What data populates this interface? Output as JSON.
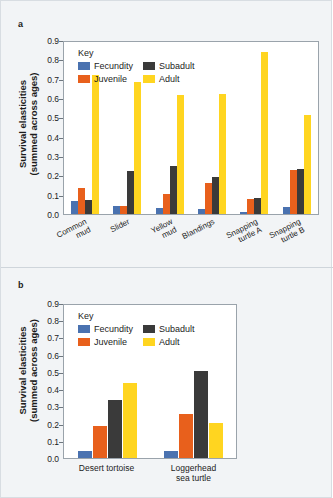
{
  "figure": {
    "background": "#f2f4f6",
    "panel_a_label": "a",
    "panel_b_label": "b"
  },
  "axis": {
    "ylabel_line1": "Survival elasticities",
    "ylabel_line2": "(summed across ages)",
    "yticks": [
      "0.9",
      "0.8",
      "0.7",
      "0.6",
      "0.5",
      "0.4",
      "0.3",
      "0.2",
      "0.1",
      "0.0"
    ]
  },
  "legend": {
    "title": "Key",
    "items": [
      {
        "label": "Fecundity",
        "color": "#4a72b0"
      },
      {
        "label": "Subadult",
        "color": "#3a3a3a"
      },
      {
        "label": "Juvenile",
        "color": "#e8601c"
      },
      {
        "label": "Adult",
        "color": "#ffd520"
      }
    ]
  },
  "chart_data": [
    {
      "type": "bar",
      "panel": "a",
      "title": "",
      "xlabel": "",
      "ylabel": "Survival elasticities (summed across ages)",
      "ylim": [
        0,
        0.9
      ],
      "ytick_step": 0.1,
      "grid": false,
      "legend_position": "inside-top-left",
      "categories": [
        "Common mud",
        "Slider",
        "Yellow mud",
        "Blandings",
        "Snapping turtle A",
        "Snapping turtle B"
      ],
      "category_lines": [
        [
          "Common",
          "mud"
        ],
        [
          "Slider"
        ],
        [
          "Yellow",
          "mud"
        ],
        [
          "Blandings"
        ],
        [
          "Snapping",
          "turtle A"
        ],
        [
          "Snapping",
          "turtle B"
        ]
      ],
      "series": [
        {
          "name": "Fecundity",
          "color": "#4a72b0",
          "values": [
            0.065,
            0.04,
            0.032,
            0.026,
            0.012,
            0.038
          ]
        },
        {
          "name": "Juvenile",
          "color": "#e8601c",
          "values": [
            0.134,
            0.04,
            0.103,
            0.16,
            0.079,
            0.228
          ]
        },
        {
          "name": "Subadult",
          "color": "#3a3a3a",
          "values": [
            0.071,
            0.224,
            0.246,
            0.192,
            0.082,
            0.231
          ]
        },
        {
          "name": "Adult",
          "color": "#ffd520",
          "values": [
            0.72,
            0.683,
            0.614,
            0.621,
            0.837,
            0.51
          ]
        }
      ]
    },
    {
      "type": "bar",
      "panel": "b",
      "title": "",
      "xlabel": "",
      "ylabel": "Survival elasticities (summed across ages)",
      "ylim": [
        0,
        0.9
      ],
      "ytick_step": 0.1,
      "grid": false,
      "legend_position": "inside-top-left",
      "categories": [
        "Desert tortoise",
        "Loggerhead sea turtle"
      ],
      "category_lines": [
        [
          "Desert tortoise"
        ],
        [
          "Loggerhead",
          "sea turtle"
        ]
      ],
      "series": [
        {
          "name": "Fecundity",
          "color": "#4a72b0",
          "values": [
            0.038,
            0.038
          ]
        },
        {
          "name": "Juvenile",
          "color": "#e8601c",
          "values": [
            0.188,
            0.254
          ]
        },
        {
          "name": "Subadult",
          "color": "#3a3a3a",
          "values": [
            0.339,
            0.506
          ]
        },
        {
          "name": "Adult",
          "color": "#ffd520",
          "values": [
            0.433,
            0.204
          ]
        }
      ]
    }
  ]
}
